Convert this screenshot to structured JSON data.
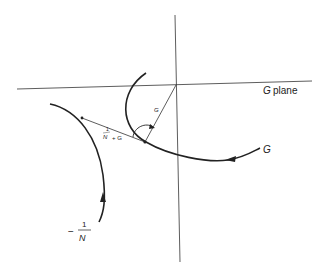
{
  "diagram": {
    "plane_label_symbol": "G",
    "plane_label_word": "plane",
    "curve_g_label": "G",
    "vector_g_label": "G",
    "sum_label_num": "1",
    "sum_label_den": "N",
    "sum_label_tail": "+ G",
    "minus_sign": "−",
    "inv_n_num": "1",
    "inv_n_den": "N",
    "colors": {
      "stroke": "#222222",
      "background": "#ffffff"
    }
  }
}
